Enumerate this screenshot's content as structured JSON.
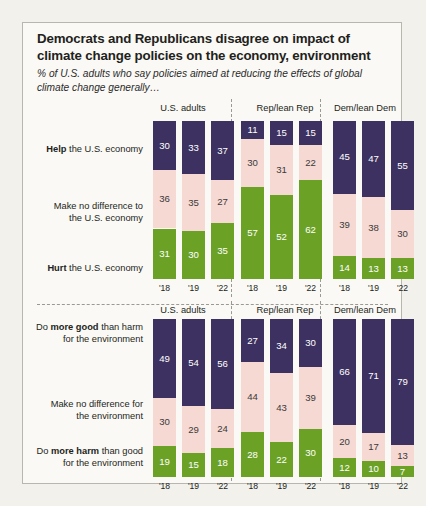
{
  "title": "Democrats and Republicans disagree on impact of climate change policies on the economy, environment",
  "subtitle": "% of U.S. adults who say policies aimed at reducing the effects of global climate change generally…",
  "colors": {
    "navy": "#3c3160",
    "pink": "#f7d9d4",
    "green": "#6ba226",
    "background": "#faf9f5",
    "page": "#f2f1ec",
    "border": "#b9b6ad"
  },
  "panels": [
    "U.S. adults",
    "Rep/lean Rep",
    "Dem/lean Dem"
  ],
  "years": [
    "'18",
    "'19",
    "'22"
  ],
  "chart_data": [
    {
      "type": "bar",
      "stacked": true,
      "title": "Democrats and Republicans disagree on impact of climate change policies on the economy, environment",
      "subtitle": "% of U.S. adults who say policies aimed at reducing the effects of global climate change generally…",
      "xlabel": "",
      "ylabel": "",
      "ylim": [
        0,
        100
      ],
      "grid": false,
      "legend_position": "row-labels-left",
      "categories": [
        "'18",
        "'19",
        "'22"
      ],
      "groups": [
        "U.S. adults",
        "Rep/lean Rep",
        "Dem/lean Dem"
      ],
      "series": [
        {
          "name": "Help the U.S. economy",
          "color": "#3c3160",
          "values": {
            "U.S. adults": [
              30,
              33,
              37
            ],
            "Rep/lean Rep": [
              11,
              15,
              15
            ],
            "Dem/lean Dem": [
              45,
              47,
              55
            ]
          }
        },
        {
          "name": "Make no difference to the U.S. economy",
          "color": "#f7d9d4",
          "values": {
            "U.S. adults": [
              36,
              35,
              27
            ],
            "Rep/lean Rep": [
              30,
              31,
              22
            ],
            "Dem/lean Dem": [
              39,
              38,
              30
            ]
          }
        },
        {
          "name": "Hurt the U.S. economy",
          "color": "#6ba226",
          "values": {
            "U.S. adults": [
              31,
              30,
              35
            ],
            "Rep/lean Rep": [
              57,
              52,
              62
            ],
            "Dem/lean Dem": [
              14,
              13,
              13
            ]
          }
        }
      ]
    },
    {
      "type": "bar",
      "stacked": true,
      "title": "",
      "subtitle": "",
      "xlabel": "",
      "ylabel": "",
      "ylim": [
        0,
        100
      ],
      "grid": false,
      "legend_position": "row-labels-left",
      "categories": [
        "'18",
        "'19",
        "'22"
      ],
      "groups": [
        "U.S. adults",
        "Rep/lean Rep",
        "Dem/lean Dem"
      ],
      "series": [
        {
          "name": "Do more good than harm for the environment",
          "color": "#3c3160",
          "values": {
            "U.S. adults": [
              49,
              54,
              56
            ],
            "Rep/lean Rep": [
              27,
              34,
              30
            ],
            "Dem/lean Dem": [
              66,
              71,
              79
            ]
          }
        },
        {
          "name": "Make no difference for the environment",
          "color": "#f7d9d4",
          "values": {
            "U.S. adults": [
              30,
              29,
              24
            ],
            "Rep/lean Rep": [
              44,
              43,
              39
            ],
            "Dem/lean Dem": [
              20,
              17,
              13
            ]
          }
        },
        {
          "name": "Do more harm than good for the environment",
          "color": "#6ba226",
          "values": {
            "U.S. adults": [
              19,
              15,
              18
            ],
            "Rep/lean Rep": [
              28,
              22,
              30
            ],
            "Dem/lean Dem": [
              12,
              10,
              7
            ]
          }
        }
      ]
    }
  ],
  "top_chart": {
    "rows": [
      {
        "prefix": "",
        "bold": "Help",
        "suffix": " the U.S. economy",
        "lines": [
          "Help the U.S. economy"
        ]
      },
      {
        "prefix": "",
        "bold": "",
        "suffix": "",
        "lines": [
          "Make no difference to",
          "the U.S. economy"
        ]
      },
      {
        "prefix": "",
        "bold": "Hurt",
        "suffix": " the U.S. economy",
        "lines": [
          "Hurt the U.S. economy"
        ]
      }
    ]
  },
  "bottom_chart": {
    "rows": [
      {
        "lines": [
          "Do more good than harm",
          "for the environment"
        ]
      },
      {
        "lines": [
          "Make no difference for",
          "the environment"
        ]
      },
      {
        "lines": [
          "Do more harm than good",
          "for the environment"
        ]
      }
    ]
  },
  "labels": {
    "top_row1_a": "Help",
    "top_row1_b": " the U.S. economy",
    "top_row2_l1": "Make no difference to",
    "top_row2_l2": "the U.S. economy",
    "top_row3_a": "Hurt",
    "top_row3_b": " the U.S. economy",
    "bot_row1_a": "Do ",
    "bot_row1_b": "more good",
    "bot_row1_c": " than harm",
    "bot_row1_l2": "for the environment",
    "bot_row2_l1": "Make no difference for",
    "bot_row2_l2": "the environment",
    "bot_row3_a": "Do ",
    "bot_row3_b": "more harm",
    "bot_row3_c": " than good",
    "bot_row3_l2": "for the environment"
  }
}
